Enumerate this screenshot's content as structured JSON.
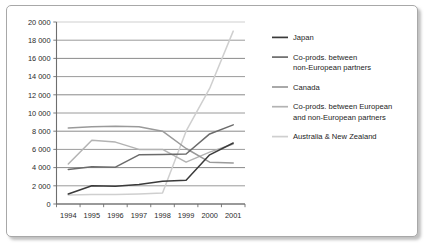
{
  "chart_data": {
    "type": "line",
    "title": "",
    "xlabel": "",
    "ylabel": "",
    "grid": "horizontal",
    "legend_position": "right",
    "ylim": [
      0,
      20000
    ],
    "ytick_step": 2000,
    "categories": [
      "1994",
      "1995",
      "1996",
      "1997",
      "1998",
      "1999",
      "2000",
      "2001"
    ],
    "ytick_labels": [
      "0",
      "2 000",
      "4 000",
      "6 000",
      "8 000",
      "10 000",
      "12 000",
      "14 000",
      "16 000",
      "18 000",
      "20 000"
    ],
    "ytick_values": [
      0,
      2000,
      4000,
      6000,
      8000,
      10000,
      12000,
      14000,
      16000,
      18000,
      20000
    ],
    "series": [
      {
        "name": "Japan",
        "color": "#3a3a3a",
        "values": [
          1100,
          2000,
          1950,
          2150,
          2500,
          2600,
          5400,
          6700
        ]
      },
      {
        "name": "Co-prods. between non-European partners",
        "color": "#6b6b6b",
        "values": [
          3800,
          4100,
          4050,
          5400,
          5450,
          5500,
          7700,
          8700
        ]
      },
      {
        "name": "Canada",
        "color": "#9a9a9a",
        "values": [
          8350,
          8500,
          8550,
          8500,
          8000,
          6100,
          4600,
          4500
        ]
      },
      {
        "name": "Co-prods. between European and non-European partners",
        "color": "#b3b3b3",
        "values": [
          4400,
          7000,
          6800,
          6000,
          6000,
          4600,
          5700,
          6600
        ]
      },
      {
        "name": "Australia & New Zealand",
        "color": "#cfcfcf",
        "values": [
          1000,
          1050,
          1050,
          1100,
          1200,
          8000,
          12700,
          19000
        ]
      }
    ]
  },
  "legend": {
    "entries": [
      {
        "label": "Japan"
      },
      {
        "label": "Co-prods. between non-European partners"
      },
      {
        "label": "Canada"
      },
      {
        "label": "Co-prods. between European and non-European partners"
      },
      {
        "label": "Australia & New Zealand"
      }
    ]
  }
}
